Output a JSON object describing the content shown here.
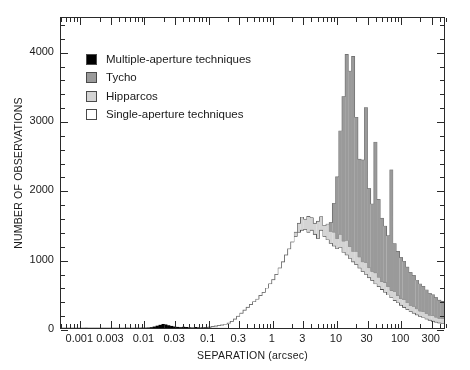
{
  "chart_data": {
    "type": "bar",
    "title": "",
    "xlabel": "SEPARATION (arcsec)",
    "ylabel": "NUMBER OF OBSERVATIONS",
    "xscale": "log",
    "xlim": [
      0.0005,
      500
    ],
    "ylim": [
      0,
      4500
    ],
    "grid": false,
    "legend_position": "top-left",
    "xtick_labels": [
      "0.001",
      "0.003",
      "0.01",
      "0.03",
      "0.1",
      "0.3",
      "1",
      "3",
      "10",
      "30",
      "100",
      "300"
    ],
    "xtick_values": [
      0.001,
      0.003,
      0.01,
      0.03,
      0.1,
      0.3,
      1,
      3,
      10,
      30,
      100,
      300
    ],
    "ytick_labels": [
      "0",
      "1000",
      "2000",
      "3000",
      "4000"
    ],
    "ytick_values": [
      0,
      1000,
      2000,
      3000,
      4000
    ],
    "ytick_minor_step": 200,
    "stacking": "stacked",
    "series": [
      {
        "name": "Single-aperture techniques",
        "color": "#ffffff",
        "order": 1
      },
      {
        "name": "Hipparcos",
        "color": "#d4d4d4",
        "order": 2
      },
      {
        "name": "Tycho",
        "color": "#9a9a9a",
        "order": 3
      },
      {
        "name": "Multiple-aperture techniques",
        "color": "#000000",
        "order": 4
      }
    ],
    "bin_edges_log10": [
      -3.3,
      -3.2,
      -3.1,
      -3.0,
      -2.9,
      -2.8,
      -2.7,
      -2.6,
      -2.5,
      -2.4,
      -2.3,
      -2.2,
      -2.1,
      -2.0,
      -1.9,
      -1.8,
      -1.7,
      -1.6,
      -1.5,
      -1.4,
      -1.3,
      -1.2,
      -1.1,
      -1.0,
      -0.9,
      -0.8,
      -0.7,
      -0.6,
      -0.5,
      -0.4,
      -0.3,
      -0.2,
      -0.1,
      0.0,
      0.1,
      0.2,
      0.3,
      0.4,
      0.5,
      0.6,
      0.7,
      0.8,
      0.9,
      1.0,
      1.1,
      1.2,
      1.3,
      1.4,
      1.5,
      1.6,
      1.7,
      1.8,
      1.9,
      2.0,
      2.1,
      2.2,
      2.3,
      2.4,
      2.5,
      2.6
    ],
    "bin_width_log10": 0.05,
    "values": {
      "single_aperture": [
        0,
        0,
        0,
        0,
        0,
        0,
        0,
        0,
        0,
        0,
        0,
        0,
        0,
        0,
        0,
        0,
        0,
        0,
        0,
        0,
        0,
        0,
        0,
        0,
        0,
        0,
        0,
        0,
        0,
        0,
        0,
        0,
        0,
        0,
        0,
        0,
        0,
        0,
        0,
        0,
        0,
        0,
        0,
        0,
        0,
        5,
        10,
        14,
        22,
        28,
        36,
        44,
        54,
        70,
        96,
        130,
        170,
        215,
        260,
        300,
        340,
        380,
        420,
        470,
        520,
        580,
        640,
        700,
        780,
        870,
        960,
        1060,
        1150,
        1250,
        1330,
        1390,
        1420,
        1430,
        1390,
        1420,
        1360,
        1300,
        1420,
        1330,
        1280,
        1230,
        1190,
        1150,
        1170,
        1100,
        1060,
        1010,
        960,
        920,
        870,
        820,
        780,
        730,
        690,
        640,
        600,
        560,
        520,
        480,
        440,
        400,
        365,
        330,
        300,
        270,
        240,
        215,
        190,
        168,
        148,
        130,
        113,
        98,
        85,
        73,
        63,
        54,
        46,
        39,
        33,
        28,
        24,
        20,
        17,
        14,
        12,
        10,
        8,
        7,
        6,
        5,
        4,
        4,
        3,
        3,
        2,
        2,
        2,
        1,
        1,
        1,
        1,
        1,
        0,
        0,
        0
      ],
      "hipparcos": [
        0,
        0,
        0,
        0,
        0,
        0,
        0,
        0,
        0,
        0,
        0,
        0,
        0,
        0,
        0,
        0,
        0,
        0,
        0,
        0,
        0,
        0,
        0,
        0,
        0,
        0,
        0,
        0,
        0,
        0,
        0,
        0,
        0,
        0,
        0,
        0,
        0,
        0,
        0,
        0,
        0,
        0,
        0,
        0,
        0,
        0,
        0,
        0,
        0,
        0,
        0,
        0,
        0,
        0,
        0,
        0,
        0,
        0,
        0,
        0,
        0,
        0,
        0,
        0,
        0,
        0,
        0,
        0,
        0,
        0,
        0,
        0,
        0,
        0,
        60,
        130,
        190,
        150,
        230,
        180,
        160,
        250,
        195,
        155,
        230,
        170,
        200,
        145,
        190,
        160,
        210,
        170,
        150,
        190,
        160,
        140,
        170,
        145,
        130,
        160,
        135,
        115,
        140,
        120,
        105,
        125,
        108,
        95,
        110,
        95,
        85,
        98,
        86,
        76,
        88,
        78,
        70,
        80,
        71,
        64,
        72,
        65,
        58,
        66,
        60,
        54,
        60,
        55,
        50,
        55,
        50,
        46,
        50,
        46,
        42,
        45,
        42,
        38,
        41,
        38,
        35,
        37,
        34,
        31,
        33,
        30,
        28,
        30,
        27,
        25
      ],
      "tycho": [
        0,
        0,
        0,
        0,
        0,
        0,
        0,
        0,
        0,
        0,
        0,
        0,
        0,
        0,
        0,
        0,
        0,
        0,
        0,
        0,
        0,
        0,
        0,
        0,
        0,
        0,
        0,
        0,
        0,
        0,
        0,
        0,
        0,
        0,
        0,
        0,
        0,
        0,
        0,
        0,
        0,
        0,
        0,
        0,
        0,
        0,
        0,
        0,
        0,
        0,
        0,
        0,
        0,
        0,
        0,
        0,
        0,
        0,
        0,
        0,
        0,
        0,
        0,
        0,
        0,
        0,
        0,
        0,
        0,
        0,
        0,
        0,
        0,
        0,
        0,
        0,
        0,
        0,
        0,
        0,
        0,
        0,
        0,
        0,
        0,
        130,
        420,
        900,
        1500,
        2100,
        2700,
        2550,
        2830,
        1950,
        1420,
        1480,
        2250,
        1150,
        980,
        1900,
        1130,
        920,
        820,
        740,
        1750,
        700,
        640,
        600,
        560,
        520,
        480,
        450,
        420,
        395,
        370,
        345,
        325,
        305,
        285,
        268,
        252,
        236,
        222,
        208,
        195,
        230,
        250,
        265,
        275,
        280,
        275,
        262,
        248,
        232,
        216,
        200,
        185,
        170,
        158,
        146,
        135,
        124,
        114,
        105,
        96,
        88,
        80,
        73,
        66,
        60,
        54,
        49,
        44,
        40,
        36,
        32,
        29,
        26,
        23,
        21,
        18,
        16,
        14,
        12,
        10,
        9,
        8,
        7,
        6,
        5,
        4,
        4,
        3,
        3,
        2,
        2,
        2,
        1,
        1,
        1,
        1,
        4,
        1
      ],
      "multiple_aperture": [
        0,
        0,
        0,
        0,
        0,
        0,
        0,
        0,
        2,
        0,
        0,
        0,
        0,
        0,
        0,
        0,
        0,
        0,
        0,
        0,
        0,
        0,
        3,
        0,
        0,
        4,
        2,
        6,
        5,
        8,
        12,
        22,
        34,
        46,
        58,
        52,
        40,
        30,
        22,
        16,
        12,
        18,
        14,
        10,
        8,
        14,
        10,
        7,
        5,
        4,
        3,
        2,
        2,
        1,
        1,
        1,
        0,
        0,
        0,
        0
      ]
    },
    "peak": {
      "separation_arcsec": 0.42,
      "value": 4250
    }
  },
  "axes": {
    "x": {
      "label": "SEPARATION (arcsec)",
      "ticks": [
        "0.001",
        "0.003",
        "0.01",
        "0.03",
        "0.1",
        "0.3",
        "1",
        "3",
        "10",
        "30",
        "100",
        "300"
      ]
    },
    "y": {
      "label": "NUMBER OF OBSERVATIONS",
      "ticks": [
        "0",
        "1000",
        "2000",
        "3000",
        "4000"
      ]
    }
  },
  "legend": {
    "items": [
      {
        "label": "Multiple-aperture techniques",
        "color": "#000000"
      },
      {
        "label": "Tycho",
        "color": "#9a9a9a"
      },
      {
        "label": "Hipparcos",
        "color": "#d4d4d4"
      },
      {
        "label": "Single-aperture techniques",
        "color": "#ffffff"
      }
    ]
  }
}
